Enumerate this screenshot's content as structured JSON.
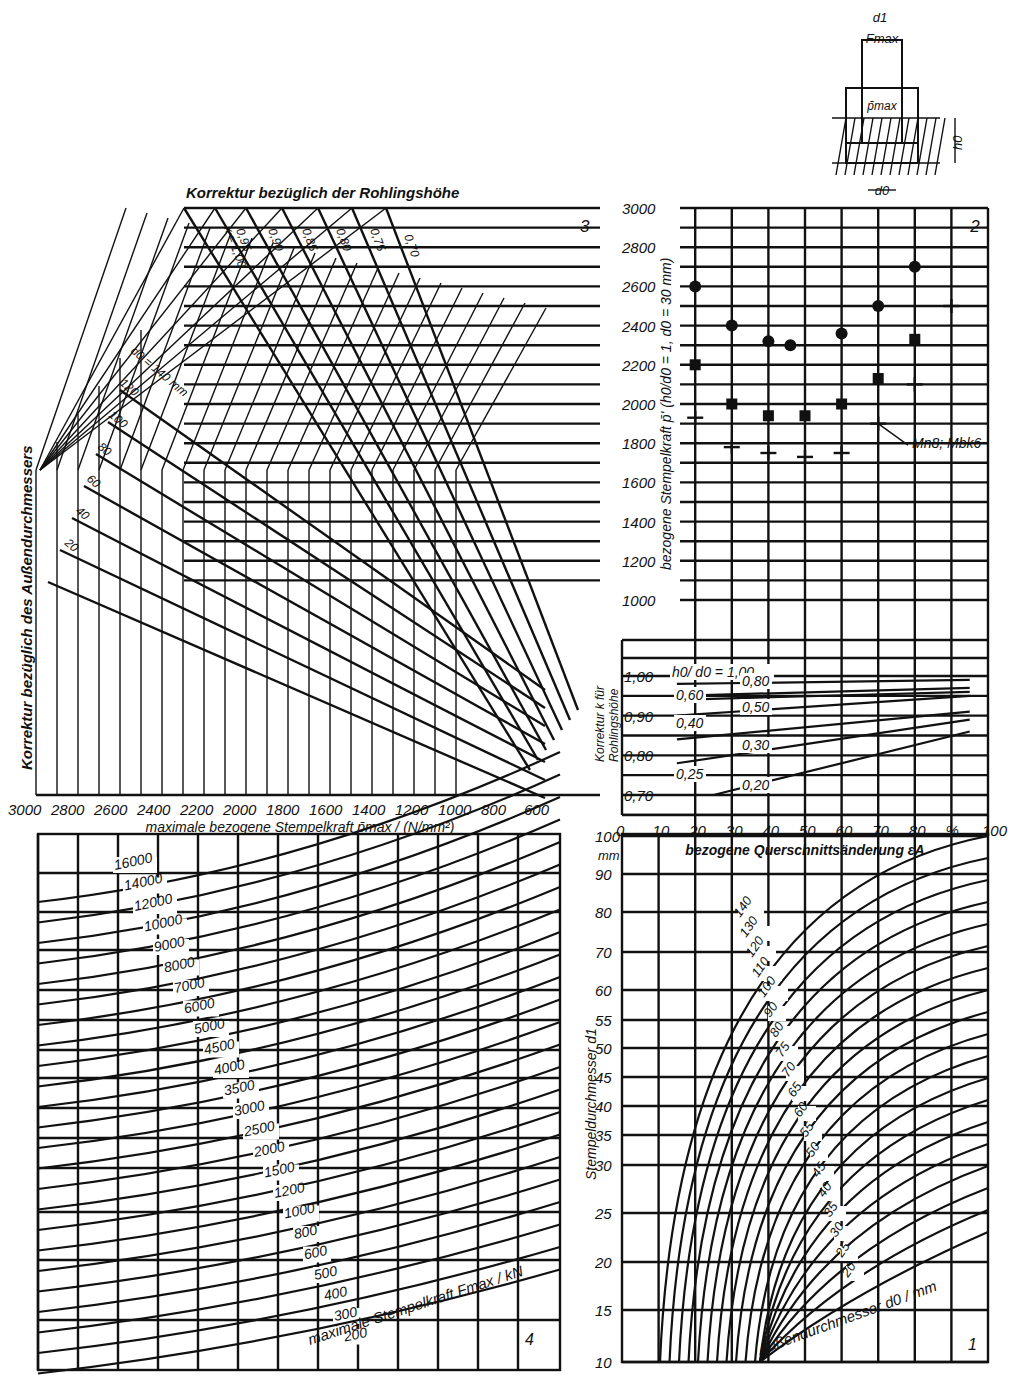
{
  "chart_data": [
    {
      "id": "chart-1",
      "type": "line",
      "panel_number": "1",
      "title": "",
      "xlabel": "bezogene Querschnittsänderung εA",
      "ylabel": "Stempeldurchmesser d1",
      "y_unit": "mm",
      "x_ticks": [
        0,
        10,
        20,
        30,
        40,
        50,
        60,
        70,
        80,
        "%",
        100
      ],
      "y_ticks": [
        10,
        15,
        20,
        25,
        30,
        35,
        40,
        45,
        50,
        55,
        60,
        70,
        80,
        90,
        100
      ],
      "curve_param_label": "Außendurchmesser d0 / mm",
      "series_labels": [
        "140",
        "130",
        "120",
        "110",
        "100",
        "90",
        "80",
        "75",
        "70",
        "65",
        "60",
        "55",
        "50",
        "45",
        "40",
        "35",
        "30",
        "25",
        "20"
      ],
      "grid": true
    },
    {
      "id": "chart-2",
      "type": "scatter",
      "panel_number": "2",
      "xlabel": "bezogene Querschnittsänderung εA",
      "ylabel": "bezogene Stempelkraft p' (h0/d0 = 1, d0 = 30 mm)",
      "x_ticks": [
        0,
        10,
        20,
        30,
        40,
        50,
        60,
        70,
        80,
        "%",
        100
      ],
      "y_ticks": [
        1000,
        1200,
        1400,
        1600,
        1800,
        2000,
        2200,
        2400,
        2600,
        2800,
        3000
      ],
      "ylim": [
        1000,
        3000
      ],
      "annotation": "Mn8; Mbk6",
      "series": [
        {
          "name": "circle",
          "marker": "circle",
          "points": [
            [
              20,
              2600
            ],
            [
              30,
              2400
            ],
            [
              40,
              2320
            ],
            [
              46,
              2300
            ],
            [
              60,
              2360
            ],
            [
              70,
              2500
            ],
            [
              80,
              2700
            ]
          ]
        },
        {
          "name": "square",
          "marker": "square",
          "points": [
            [
              20,
              2200
            ],
            [
              30,
              2000
            ],
            [
              40,
              1940
            ],
            [
              50,
              1940
            ],
            [
              60,
              2000
            ],
            [
              70,
              2130
            ],
            [
              80,
              2330
            ]
          ]
        },
        {
          "name": "cross",
          "marker": "cross",
          "points": [
            [
              20,
              1930
            ],
            [
              30,
              1780
            ],
            [
              40,
              1750
            ],
            [
              50,
              1730
            ],
            [
              60,
              1750
            ],
            [
              70,
              1900
            ],
            [
              80,
              2100
            ],
            [
              90,
              2500
            ]
          ]
        }
      ],
      "grid": true
    },
    {
      "id": "chart-2b",
      "type": "line",
      "ylabel": "Korrektur k für Rohlingshöhe",
      "xlabel": "bezogene Querschnittsänderung εA",
      "y_ticks": [
        "0,70",
        "0,80",
        "0,90",
        "1,00"
      ],
      "x_ticks": [
        0,
        10,
        20,
        30,
        40,
        50,
        60,
        70,
        80,
        "%",
        100
      ],
      "series_labels": [
        "h0/d0 = 1,00",
        "0,80",
        "0,60",
        "0,50",
        "0,40",
        "0,30",
        "0,25",
        "0,20"
      ],
      "series": [
        {
          "name": "1,00",
          "x": [
            15,
            95
          ],
          "y": [
            1.0,
            1.0
          ]
        },
        {
          "name": "0,80",
          "x": [
            15,
            95
          ],
          "y": [
            0.98,
            0.99
          ]
        },
        {
          "name": "0,60",
          "x": [
            15,
            95
          ],
          "y": [
            0.95,
            0.97
          ]
        },
        {
          "name": "0,50",
          "x": [
            15,
            95
          ],
          "y": [
            0.94,
            0.96
          ]
        },
        {
          "name": "0,40",
          "x": [
            15,
            95
          ],
          "y": [
            0.9,
            0.95
          ]
        },
        {
          "name": "0,30",
          "x": [
            15,
            95
          ],
          "y": [
            0.84,
            0.91
          ]
        },
        {
          "name": "0,25",
          "x": [
            15,
            95
          ],
          "y": [
            0.78,
            0.89
          ]
        },
        {
          "name": "0,20",
          "x": [
            25,
            95
          ],
          "y": [
            0.7,
            0.86
          ]
        }
      ]
    },
    {
      "id": "chart-3",
      "type": "line",
      "panel_number": "3",
      "title": "Korrektur bezüglich der Rohlingshöhe",
      "side_title": "Korrektur bezüglich des Außendurchmessers",
      "xlabel": "maximale bezogene Stempelkraft p̄max / (N/mm²)",
      "x_ticks": [
        3000,
        2800,
        2600,
        2400,
        2200,
        2000,
        1800,
        1600,
        1400,
        1200,
        1000,
        800,
        600
      ],
      "k_labels": [
        "k = 1,00",
        "0,95",
        "0,90",
        "0,85",
        "0,80",
        "0,75",
        "0,70"
      ],
      "d0_labels": [
        "d0 = 140 mm",
        "120",
        "100",
        "80",
        "60",
        "40",
        "20"
      ]
    },
    {
      "id": "chart-4",
      "type": "line",
      "panel_number": "4",
      "curve_param_label": "maximale Stempelkraft Fmax / kN",
      "series_labels": [
        "16000",
        "14000",
        "12000",
        "10000",
        "9000",
        "8000",
        "7000",
        "6000",
        "5000",
        "4500",
        "4000",
        "3500",
        "3000",
        "2500",
        "2000",
        "1500",
        "1200",
        "1000",
        "800",
        "600",
        "500",
        "400",
        "300",
        "200"
      ],
      "grid": true
    }
  ],
  "schematic": {
    "labels": {
      "d1": "d1",
      "fmax": "Fmax",
      "pmax": "p̄max",
      "h0": "h0",
      "d0": "d0"
    }
  },
  "labels": {
    "panel1": "1",
    "panel2": "2",
    "panel3": "3",
    "panel4": "4",
    "top_title": "Korrektur bezüglich der Rohlingshöhe",
    "side_title": "Korrektur bezüglich des Außendurchmessers",
    "x3_label": "maximale bezogene Stempelkraft p̄max / (N/mm²)",
    "x2_label": "bezogene Querschnittsänderung εA",
    "y2_label": "bezogene Stempelkraft p̄' (h0/d0 = 1, d0 = 30 mm)",
    "y2b_label1": "Korrektur k für",
    "y2b_label2": "Rohlingshöhe",
    "y1_label": "Stempeldurchmesser d1",
    "y1_unit": "mm",
    "f_label": "maximale Stempelkraft Fmax / kN",
    "d0_label": "Außendurchmesser d0 / mm",
    "annotation": "Mn8; Mbk6"
  }
}
